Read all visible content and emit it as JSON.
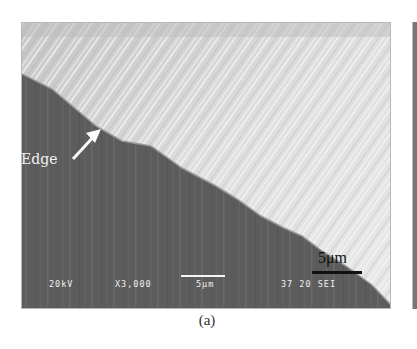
{
  "figure": {
    "caption": "(a)",
    "image_type": "SEM micrograph",
    "annotation": {
      "label": "Edge",
      "arrow": "arrow-pointing-to-edge"
    },
    "scale_bar_label": "5μm",
    "sem_info": {
      "voltage": "20kV",
      "magnification": "X3,000",
      "scale": "5μm",
      "id": "37 20 SEI"
    },
    "colors": {
      "dark_region": "#5e5e5e",
      "light_region": "#d6d6d6",
      "text": "#f0f0f0"
    }
  }
}
